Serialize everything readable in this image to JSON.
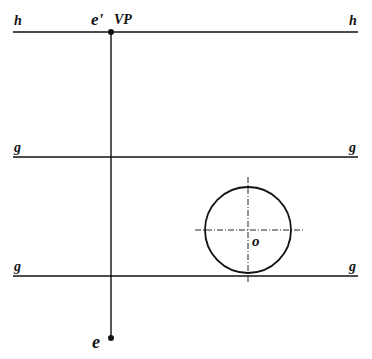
{
  "diagram": {
    "type": "perspective-projection",
    "labels": {
      "horizon_left": "h",
      "horizon_right": "h",
      "eye_projection": "e'",
      "vanishing_point": "VP",
      "ground_top_left": "g",
      "ground_top_right": "g",
      "ground_bottom_left": "g",
      "ground_bottom_right": "g",
      "circle_center": "o",
      "eye": "e"
    },
    "colors": {
      "line": "#111111",
      "background": "#ffffff"
    }
  }
}
